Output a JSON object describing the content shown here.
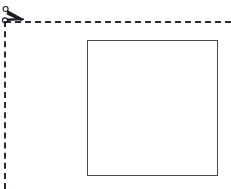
{
  "figure": {
    "type": "cut-crop-diagram",
    "background_color": "#ffffff",
    "title": "",
    "caption": ""
  },
  "cut_lines": {
    "style": "dashed",
    "color": "#2b2b38",
    "thickness_px": 2,
    "dash_length_px": 6,
    "gap_length_px": 4,
    "horizontal": {
      "label": "horizontal-cut-line",
      "x_start": 5,
      "x_end": 231,
      "y": 22
    },
    "vertical": {
      "label": "vertical-cut-line",
      "x": 5,
      "y_start": 22,
      "y_end": 189
    }
  },
  "scissors": {
    "label": "scissors",
    "color": "#1c1c22",
    "x": 0,
    "y": 4,
    "width": 28,
    "height": 24,
    "orientation": "blades-pointing-right"
  },
  "rectangle": {
    "label": "rectangle",
    "fill_color": "#ffffff",
    "border_color": "#4a4a52",
    "border_width_px": 1,
    "x": 87,
    "y": 40,
    "width": 131,
    "height": 136
  }
}
